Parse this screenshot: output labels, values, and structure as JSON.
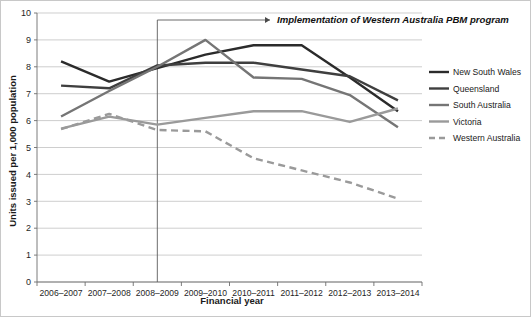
{
  "chart_data": {
    "type": "line",
    "title": "",
    "xlabel": "Financial year",
    "ylabel": "Units issued per 1,000 population",
    "categories": [
      "2006–2007",
      "2007–2008",
      "2008–2009",
      "2009–2010",
      "2010–2011",
      "2011–2012",
      "2012–2013",
      "2013–2014"
    ],
    "ylim": [
      0,
      10
    ],
    "yticks": [
      0,
      1,
      2,
      3,
      4,
      5,
      6,
      7,
      8,
      9,
      10
    ],
    "grid": "horizontal",
    "legend_position": "right",
    "series": [
      {
        "name": "New South Wales",
        "values": [
          8.2,
          7.45,
          7.95,
          8.45,
          8.8,
          8.8,
          7.6,
          6.35
        ],
        "color": "#2b2b2b",
        "width": 2.4,
        "style": "solid"
      },
      {
        "name": "Queensland",
        "values": [
          7.3,
          7.2,
          8.05,
          8.15,
          8.15,
          7.9,
          7.65,
          6.75
        ],
        "color": "#3f3f3f",
        "width": 2.4,
        "style": "solid"
      },
      {
        "name": "South Australia",
        "values": [
          6.15,
          7.1,
          8.0,
          9.0,
          7.6,
          7.55,
          6.95,
          5.75
        ],
        "color": "#757575",
        "width": 2.4,
        "style": "solid"
      },
      {
        "name": "Victoria",
        "values": [
          5.7,
          6.15,
          5.85,
          6.1,
          6.35,
          6.35,
          5.95,
          6.45
        ],
        "color": "#9a9a9a",
        "width": 2.4,
        "style": "solid"
      },
      {
        "name": "Western Australia",
        "values": [
          5.68,
          6.25,
          5.65,
          5.6,
          4.6,
          4.15,
          3.7,
          3.1
        ],
        "color": "#9a9a9a",
        "width": 2.4,
        "style": "dashed"
      }
    ],
    "annotations": [
      {
        "text": "Implementation of Western Australia PBM program",
        "marker_category": "2008–2009",
        "arrow": "→"
      }
    ]
  },
  "legend": {
    "entries": [
      {
        "label": "New South Wales"
      },
      {
        "label": "Queensland"
      },
      {
        "label": "South Australia"
      },
      {
        "label": "Victoria"
      },
      {
        "label": "Western Australia"
      }
    ]
  }
}
